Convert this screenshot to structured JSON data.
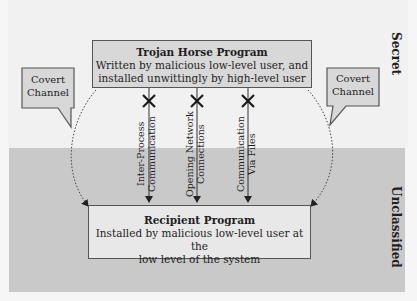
{
  "zones": {
    "secret": {
      "label": "Secret",
      "color": "#f1f1f1"
    },
    "unclassified": {
      "label": "Unclassified",
      "color": "#c9c9c9"
    }
  },
  "trojan_box": {
    "title": "Trojan Horse Program",
    "line1": "Written by malicious low-level user, and",
    "line2": "installed unwittingly by high-level user"
  },
  "recipient_box": {
    "title": "Recipient Program",
    "line1": "Installed by malicious low-level user at the",
    "line2": "low level of the system"
  },
  "blocked_channels": [
    {
      "line1": "Inter-Process",
      "line2": "Communication",
      "blocked": true
    },
    {
      "line1": "Opening Network",
      "line2": "Connections",
      "blocked": true
    },
    {
      "line1": "Communication",
      "line2": "Via Files",
      "blocked": true
    }
  ],
  "covert_channels": [
    {
      "line1": "Covert",
      "line2": "Channel",
      "side": "left"
    },
    {
      "line1": "Covert",
      "line2": "Channel",
      "side": "right"
    }
  ]
}
